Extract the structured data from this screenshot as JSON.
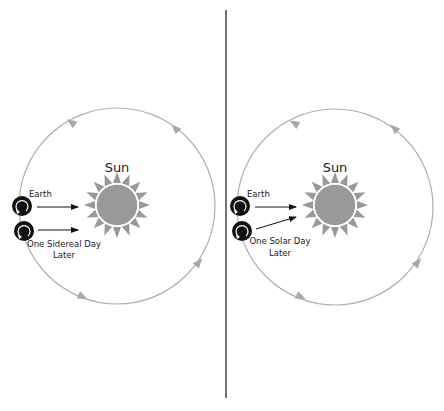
{
  "colors": {
    "orbit": "#b0b0b0",
    "orbit_arrow": "#a8a8a8",
    "sun": "#999999",
    "sun_rays": "#999999",
    "earth": "#111111",
    "divider": "#444444",
    "arrow": "#111111"
  },
  "panels": [
    {
      "id": "sidereal",
      "sun_label": "Sun",
      "earth_label": "Earth",
      "later_label_line1": "One Sidereal Day",
      "later_label_line2": "Later"
    },
    {
      "id": "solar",
      "sun_label": "Sun",
      "earth_label": "Earth",
      "later_label_line1": "One Solar Day",
      "later_label_line2": "Later"
    }
  ]
}
